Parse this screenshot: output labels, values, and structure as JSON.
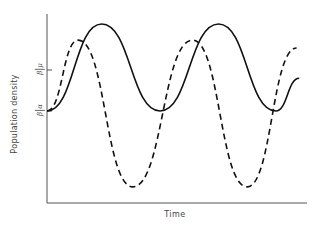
{
  "chart_data": {
    "type": "line",
    "title": "",
    "xlabel": "Time",
    "ylabel": "Population density",
    "xlim": [
      0,
      100
    ],
    "ylim": [
      0,
      100
    ],
    "grid": false,
    "legend": null,
    "y_ticks": [
      {
        "label": "μ/β",
        "numerator": "μ",
        "denominator": "β",
        "value": 70.4
      },
      {
        "label": "α/β",
        "numerator": "α",
        "denominator": "β",
        "value": 48.7
      }
    ],
    "series": [
      {
        "name": "solid",
        "style": "solid",
        "color": "#111111",
        "x": [
          0,
          21,
          43.5,
          66,
          88,
          97
        ],
        "y": [
          48.7,
          94.7,
          48.7,
          94.7,
          48.7,
          66
        ]
      },
      {
        "name": "dashed",
        "style": "dashed",
        "color": "#111111",
        "x": [
          0,
          12,
          33,
          56,
          77,
          96
        ],
        "y": [
          48.7,
          86.2,
          8.5,
          86.2,
          8.5,
          82
        ]
      }
    ]
  },
  "labels": {
    "x_axis": "Time",
    "y_axis": "Population density",
    "tick_upper_num": "μ",
    "tick_upper_den": "β",
    "tick_lower_num": "α",
    "tick_lower_den": "β"
  }
}
